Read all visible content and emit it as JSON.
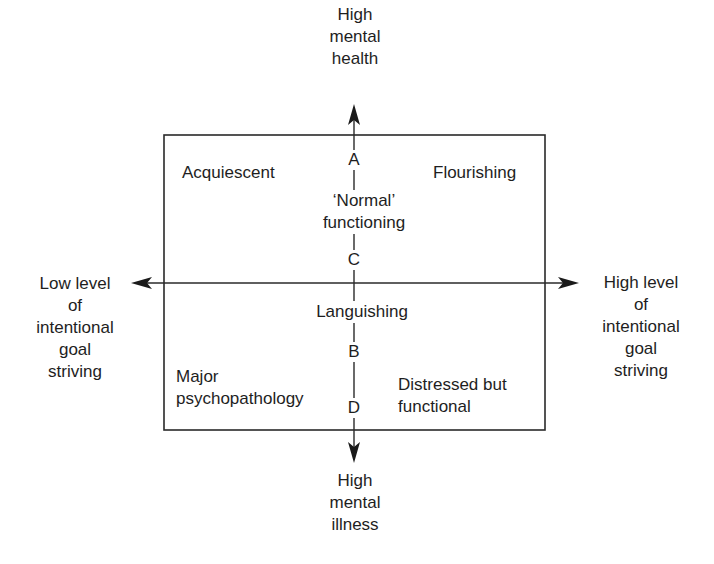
{
  "axes": {
    "top": [
      "High",
      "mental",
      "health"
    ],
    "bottom": [
      "High",
      "mental",
      "illness"
    ],
    "left": [
      "Low level",
      "of",
      "intentional",
      "goal",
      "striving"
    ],
    "right": [
      "High level",
      "of",
      "intentional",
      "goal",
      "striving"
    ]
  },
  "quadrants": {
    "top_left": "Acquiescent",
    "top_right": "Flourishing",
    "bottom_left": [
      "Major",
      "psychopathology"
    ],
    "bottom_right": [
      "Distressed but",
      "functional"
    ]
  },
  "center_labels": {
    "normal": [
      "‘Normal’",
      "functioning"
    ],
    "languishing": "Languishing"
  },
  "points": {
    "A": "A",
    "B": "B",
    "C": "C",
    "D": "D"
  },
  "colors": {
    "line": "#2a2a2a",
    "text": "#1e1e1e",
    "background": "#ffffff"
  }
}
